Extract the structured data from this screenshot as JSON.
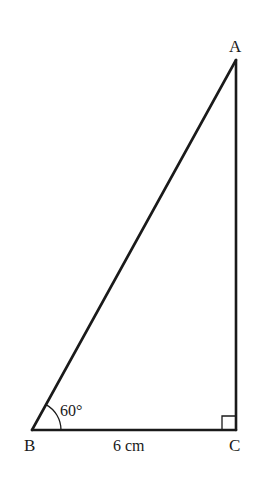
{
  "diagram": {
    "type": "right-triangle",
    "vertices": [
      {
        "name": "A",
        "label": "A"
      },
      {
        "name": "B",
        "label": "B"
      },
      {
        "name": "C",
        "label": "C"
      }
    ],
    "side_BC_label": "6 cm",
    "angle_B_label": "60°",
    "right_angle_at": "C",
    "stroke_color": "#1a1a1a",
    "background": "#ffffff"
  }
}
